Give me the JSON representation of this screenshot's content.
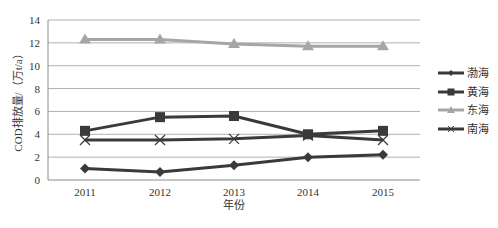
{
  "chart_data": {
    "type": "line",
    "title": "",
    "xlabel": "年份",
    "ylabel": "COD排放量/（万t/a）",
    "categories": [
      "2011",
      "2012",
      "2013",
      "2014",
      "2015"
    ],
    "ylim": [
      0,
      14
    ],
    "yticks": [
      0,
      2,
      4,
      6,
      8,
      10,
      12,
      14
    ],
    "grid": true,
    "legend_position": "right",
    "series": [
      {
        "name": "渤海",
        "marker": "diamond",
        "color": "#3a3a3a",
        "values": [
          1.0,
          0.7,
          1.3,
          2.0,
          2.2
        ]
      },
      {
        "name": "黄海",
        "marker": "square",
        "color": "#3a3a3a",
        "values": [
          4.3,
          5.5,
          5.6,
          4.0,
          4.3
        ]
      },
      {
        "name": "东海",
        "marker": "triangle",
        "color": "#a6a6a6",
        "values": [
          12.3,
          12.3,
          11.9,
          11.7,
          11.7
        ]
      },
      {
        "name": "南海",
        "marker": "x",
        "color": "#3a3a3a",
        "values": [
          3.5,
          3.5,
          3.6,
          3.9,
          3.5
        ]
      }
    ]
  },
  "layout": {
    "plot": {
      "left": 48,
      "top": 20,
      "right": 420,
      "bottom": 180
    },
    "x_positions": [
      85,
      160,
      234,
      308,
      383
    ],
    "gridline_color": "#b0b0b0",
    "axis_color": "#8c8c8c"
  }
}
